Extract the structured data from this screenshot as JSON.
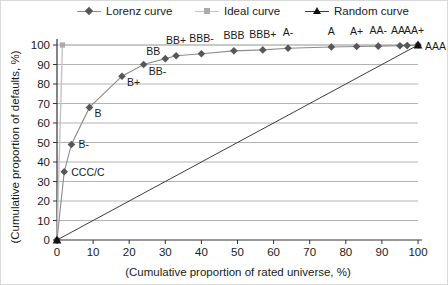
{
  "legend": {
    "items": [
      {
        "label": "Lorenz curve",
        "marker": "diamond",
        "marker_color": "#575757",
        "line_color": "#8c8c8c"
      },
      {
        "label": "Ideal curve",
        "marker": "square",
        "marker_color": "#ababab",
        "line_color": "#c4c4c4"
      },
      {
        "label": "Random curve",
        "marker": "triangle",
        "marker_color": "#111111",
        "line_color": "#3d3d3d"
      }
    ]
  },
  "chart_data": {
    "type": "line",
    "title": "",
    "xlabel": "(Cumulative proportion of rated universe, %)",
    "ylabel": "(Cumulative proportion of defaults, %)",
    "xlim": [
      0,
      100
    ],
    "ylim": [
      0,
      100
    ],
    "xticks": [
      0,
      10,
      20,
      30,
      40,
      50,
      60,
      70,
      80,
      90,
      100
    ],
    "yticks": [
      0,
      10,
      20,
      30,
      40,
      50,
      60,
      70,
      80,
      90,
      100
    ],
    "grid": "horizontal",
    "legend_position": "top",
    "colors": {
      "grid": "#b3b3b3",
      "axis": "#333333",
      "text": "#1a1a1a"
    },
    "series": [
      {
        "name": "Ideal curve",
        "marker": "square",
        "line_color": "#c4c4c4",
        "marker_color": "#ababab",
        "line_width": 1.4,
        "points": [
          {
            "x": 0,
            "y": 0
          },
          {
            "x": 1.5,
            "y": 100
          },
          {
            "x": 100,
            "y": 100
          }
        ]
      },
      {
        "name": "Lorenz curve",
        "marker": "diamond",
        "line_color": "#8c8c8c",
        "marker_color": "#575757",
        "line_width": 1.1,
        "points": [
          {
            "x": 0,
            "y": 0
          },
          {
            "x": 2,
            "y": 35,
            "label": "CCC/C",
            "lp": "r"
          },
          {
            "x": 4,
            "y": 49,
            "label": "B-",
            "lp": "r"
          },
          {
            "x": 9,
            "y": 68,
            "label": "B",
            "lp": "br"
          },
          {
            "x": 18,
            "y": 84,
            "label": "B+",
            "lp": "br"
          },
          {
            "x": 24,
            "y": 90,
            "label": "BB-",
            "lp": "br"
          },
          {
            "x": 30,
            "y": 93,
            "label": "BB",
            "lp": "al"
          },
          {
            "x": 33,
            "y": 94.5,
            "label": "BB+",
            "lp": "a"
          },
          {
            "x": 40,
            "y": 95.5,
            "label": "BBB-",
            "lp": "a"
          },
          {
            "x": 49,
            "y": 97,
            "label": "BBB",
            "lp": "a"
          },
          {
            "x": 57,
            "y": 97.5,
            "label": "BBB+",
            "lp": "a"
          },
          {
            "x": 64,
            "y": 98.3,
            "label": "A-",
            "lp": "a"
          },
          {
            "x": 76,
            "y": 99,
            "label": "A",
            "lp": "a"
          },
          {
            "x": 83,
            "y": 99.2,
            "label": "A+",
            "lp": "a"
          },
          {
            "x": 89,
            "y": 99.4,
            "label": "AA-",
            "lp": "a"
          },
          {
            "x": 95,
            "y": 99.6,
            "label": "AA",
            "lp": "a",
            "ldx": -2
          },
          {
            "x": 97,
            "y": 99.7,
            "label": "AA+",
            "lp": "a",
            "ldx": 7
          },
          {
            "x": 100,
            "y": 100,
            "label": "AAA",
            "lp": "e"
          }
        ]
      },
      {
        "name": "Random curve",
        "marker": "triangle",
        "line_color": "#3d3d3d",
        "marker_color": "#111111",
        "line_width": 1,
        "points": [
          {
            "x": 0,
            "y": 0
          },
          {
            "x": 100,
            "y": 100
          }
        ]
      }
    ]
  }
}
